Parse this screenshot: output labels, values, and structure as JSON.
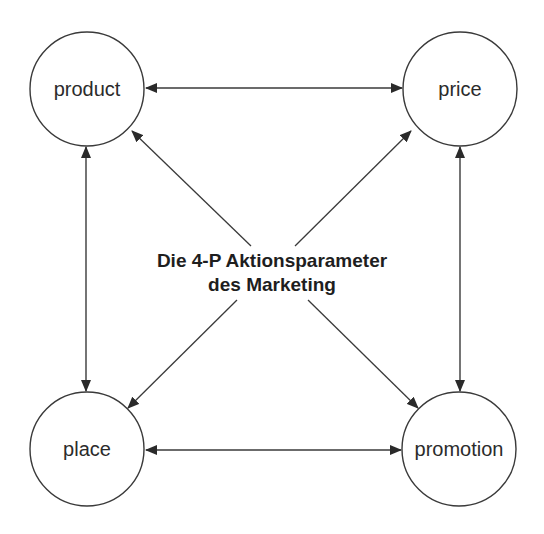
{
  "diagram": {
    "title_line1": "Die 4-P Aktionsparameter",
    "title_line2": "des Marketing",
    "nodes": [
      {
        "id": "product",
        "label": "product",
        "cx": 87,
        "cy": 89,
        "r": 57
      },
      {
        "id": "price",
        "label": "price",
        "cx": 460,
        "cy": 89,
        "r": 57
      },
      {
        "id": "place",
        "label": "place",
        "cx": 87,
        "cy": 449,
        "r": 57
      },
      {
        "id": "promotion",
        "label": "promotion",
        "cx": 459,
        "cy": 449,
        "r": 57
      }
    ],
    "edges": [
      {
        "from": "product",
        "to": "price",
        "type": "bidirectional"
      },
      {
        "from": "place",
        "to": "promotion",
        "type": "bidirectional"
      },
      {
        "from": "product",
        "to": "place",
        "type": "bidirectional"
      },
      {
        "from": "price",
        "to": "promotion",
        "type": "bidirectional"
      },
      {
        "from": "center",
        "to": "product",
        "type": "directed"
      },
      {
        "from": "center",
        "to": "price",
        "type": "directed"
      },
      {
        "from": "center",
        "to": "place",
        "type": "directed"
      },
      {
        "from": "center",
        "to": "promotion",
        "type": "directed"
      }
    ],
    "colors": {
      "stroke": "#3a3a3a",
      "text": "#2b2b2b",
      "background": "#ffffff"
    }
  }
}
